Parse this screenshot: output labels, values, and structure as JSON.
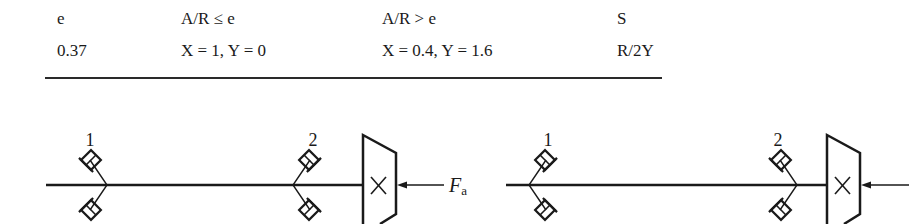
{
  "table": {
    "headers": [
      "e",
      "A/R ≤ e",
      "A/R > e",
      "S"
    ],
    "rows": [
      [
        "0.37",
        "X = 1, Y = 0",
        "X = 0.4, Y = 1.6",
        "R/2Y"
      ]
    ]
  },
  "diagrams": [
    {
      "name": "left-arrangement",
      "bearing_labels": [
        "1",
        "2"
      ],
      "force_label": "F",
      "force_subscript": "a",
      "gear_mark": "×"
    },
    {
      "name": "right-arrangement",
      "bearing_labels": [
        "1",
        "2"
      ],
      "gear_mark": "×"
    }
  ],
  "colors": {
    "ink": "#1a1a1a",
    "background": "#ffffff"
  }
}
